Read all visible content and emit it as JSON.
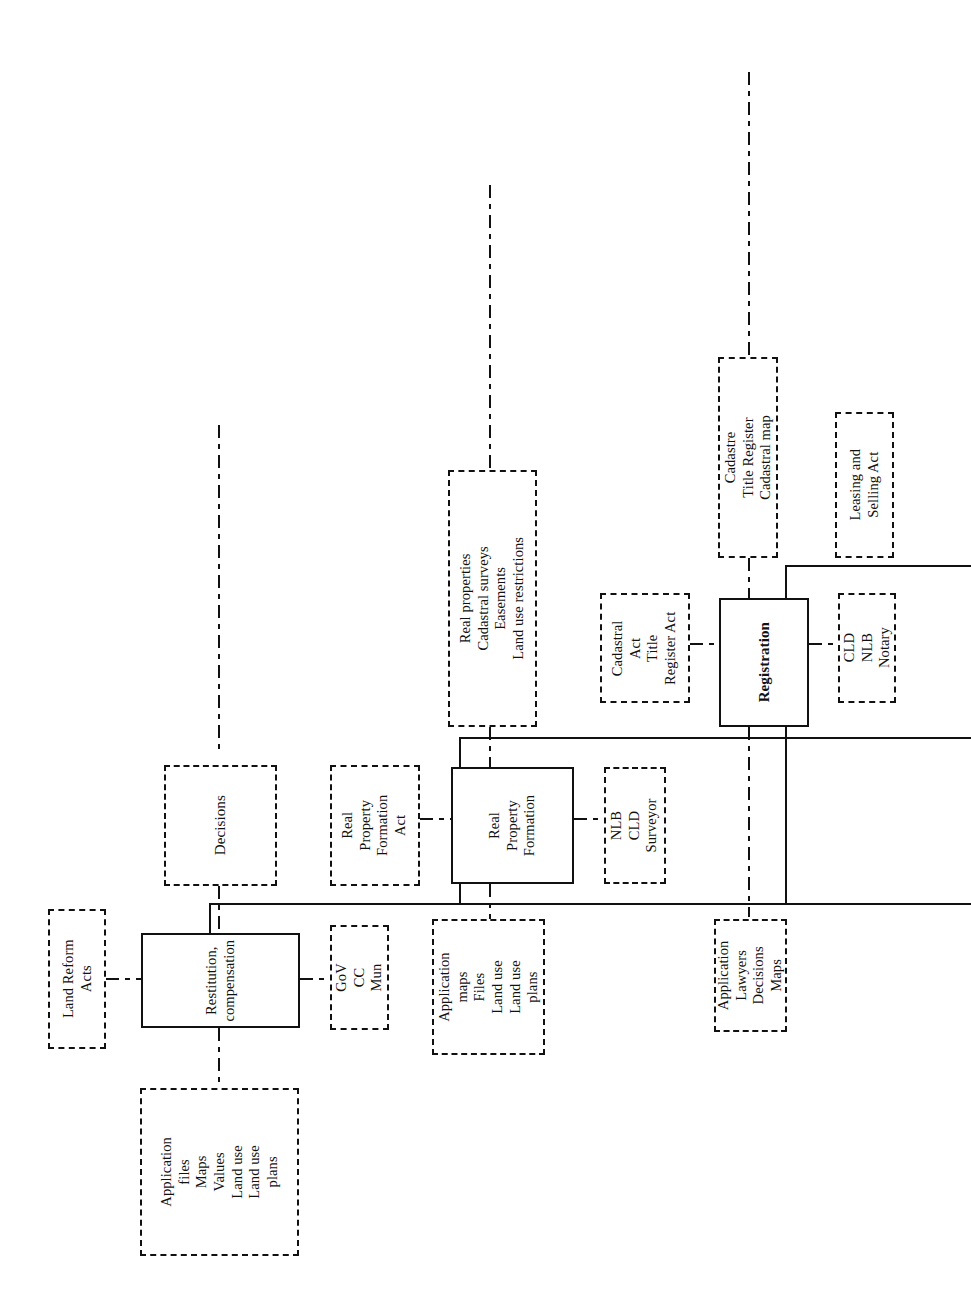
{
  "diagram": {
    "orientation": "rotated-90-ccw",
    "nodes": {
      "land_reform_acts": {
        "label": "Land Reform\nActs"
      },
      "restitution": {
        "label": "Restitution,\ncompensation"
      },
      "gov_cc_mun": {
        "label": "GoV\nCC\nMun"
      },
      "application_files": {
        "label": "Application\nfiles\nMaps\nValues\nLand use\nLand use\nplans"
      },
      "decisions": {
        "label": "Decisions"
      },
      "rpf_act": {
        "label": "Real\nProperty\nFormation\nAct"
      },
      "real_property_formation": {
        "label": "Real\nProperty\nFormation"
      },
      "nlb_cld_surveyor": {
        "label": "NLB\nCLD\nSurveyor"
      },
      "application_maps": {
        "label": "Application\nmaps\nFiles\nLand use\nLand use\nplans"
      },
      "real_properties": {
        "label": "Real properties\nCadastral surveys\nEasements\nLand use restrictions"
      },
      "cadastral_act": {
        "label": "Cadastral\nAct\nTitle\nRegister Act"
      },
      "registration": {
        "label": "Registration"
      },
      "cld_nlb_notary": {
        "label": "CLD\nNLB\nNotary"
      },
      "cadastre_title_register": {
        "label": "Cadastre\nTitle Register\nCadastral map"
      },
      "leasing_selling_act": {
        "label": "Leasing and\nSelling Act"
      },
      "application_lawyers": {
        "label": "Application\nLawyers\nDecisions\nMaps"
      }
    },
    "styles": {
      "solid_border": "#111111",
      "dashed_border": "#111111",
      "background": "#ffffff"
    }
  }
}
